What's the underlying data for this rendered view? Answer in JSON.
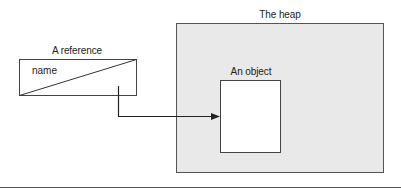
{
  "diagram": {
    "heap": {
      "label": "The heap",
      "fill": "#e9e9e9",
      "stroke": "#555555"
    },
    "reference": {
      "label": "A reference",
      "field_name": "name"
    },
    "object": {
      "label": "An object",
      "fill": "#ffffff"
    },
    "arrow": {
      "from": "reference",
      "to": "object"
    }
  },
  "colors": {
    "line": "#333333",
    "heap_fill": "#e9e9e9"
  }
}
